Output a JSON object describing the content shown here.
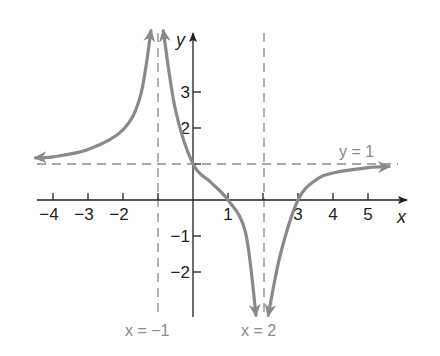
{
  "chart_data": {
    "type": "line",
    "title": "",
    "xlabel": "x",
    "ylabel": "y",
    "xlim": [
      -4.5,
      6
    ],
    "ylim": [
      -3.2,
      4.7
    ],
    "grid": false,
    "x_ticks": [
      -4,
      -3,
      -2,
      1,
      3,
      4,
      5
    ],
    "x_tick_labels": [
      "−4",
      "−3",
      "−2",
      "1",
      "3",
      "4",
      "5"
    ],
    "y_ticks": [
      3,
      2,
      -1,
      -2
    ],
    "y_tick_labels": [
      "3",
      "2",
      "−1",
      "−2"
    ],
    "asymptotes": {
      "vertical": [
        {
          "x": -1,
          "label": "x = −1"
        },
        {
          "x": 2,
          "label": "x = 2"
        }
      ],
      "horizontal": [
        {
          "y": 1,
          "label": "y = 1"
        }
      ]
    },
    "series": [
      {
        "name": "branch-left",
        "points": [
          [
            -4.5,
            1.17
          ],
          [
            -4,
            1.2
          ],
          [
            -3,
            1.4
          ],
          [
            -2,
            1.95
          ],
          [
            -1.5,
            2.9
          ],
          [
            -1.2,
            4.7
          ]
        ]
      },
      {
        "name": "branch-middle",
        "points": [
          [
            -0.85,
            4.7
          ],
          [
            -0.5,
            2.5
          ],
          [
            0,
            1
          ],
          [
            0.5,
            0.5
          ],
          [
            1,
            0
          ],
          [
            1.5,
            -0.9
          ],
          [
            1.8,
            -3.2
          ]
        ]
      },
      {
        "name": "branch-right",
        "points": [
          [
            2.15,
            -3.2
          ],
          [
            2.5,
            -1.5
          ],
          [
            3,
            0
          ],
          [
            3.5,
            0.55
          ],
          [
            4,
            0.75
          ],
          [
            5,
            0.9
          ],
          [
            5.6,
            0.93
          ]
        ]
      }
    ],
    "intercepts": {
      "x": [
        1,
        3
      ],
      "y": [
        1
      ]
    },
    "colors": {
      "curve": "#8a8a8a",
      "axes": "#231f20",
      "asymptote": "#8a8a8a"
    }
  }
}
